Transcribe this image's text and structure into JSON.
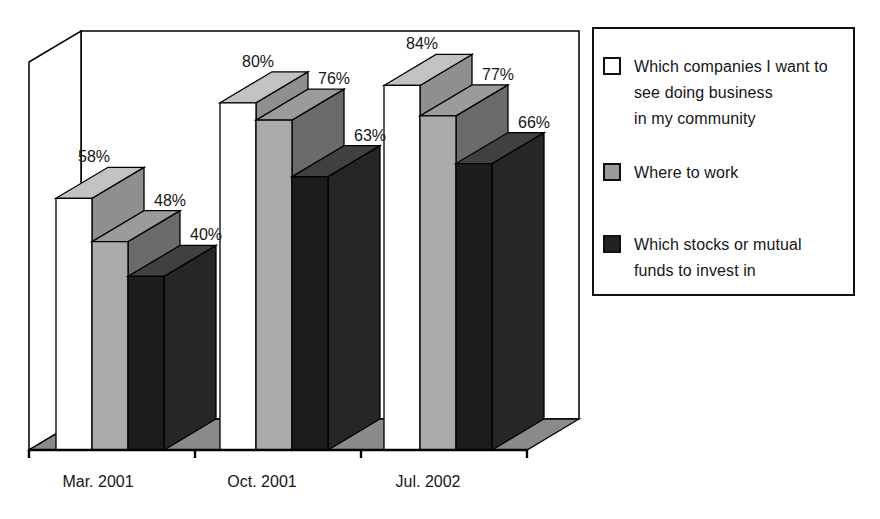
{
  "chart_data": {
    "type": "bar",
    "projection": "3d-oblique",
    "title": "",
    "xlabel": "",
    "ylabel": "",
    "unit": "percent",
    "ylim": [
      0,
      90
    ],
    "grid": false,
    "legend_position": "right",
    "categories": [
      "Mar. 2001",
      "Oct. 2001",
      "Jul. 2002"
    ],
    "series": [
      {
        "name": "Which companies I want to see doing business in my community",
        "values": [
          58,
          80,
          84
        ],
        "data_labels": [
          "58%",
          "80%",
          "84%"
        ],
        "face_front": "#ffffff",
        "face_top": "#c2c2c2",
        "face_side": "#8f8f8f"
      },
      {
        "name": "Where to work",
        "values": [
          48,
          76,
          77
        ],
        "data_labels": [
          "48%",
          "76%",
          "77%"
        ],
        "face_front": "#aaaaaa",
        "face_top": "#9b9b9b",
        "face_side": "#6b6b6b"
      },
      {
        "name": "Which stocks or mutual funds to invest in",
        "values": [
          40,
          63,
          66
        ],
        "data_labels": [
          "40%",
          "63%",
          "66%"
        ],
        "face_front": "#1d1d1d",
        "face_top": "#404040",
        "face_side": "#262626"
      }
    ]
  },
  "legend": {
    "entries": [
      {
        "label": "Which companies I want to\nsee doing business\nin my community",
        "swatch_color": "#ffffff"
      },
      {
        "label": "Where to work",
        "swatch_color": "#999999"
      },
      {
        "label": "Which stocks or mutual\nfunds to invest in",
        "swatch_color": "#222222"
      }
    ]
  },
  "colors": {
    "background": "#ffffff",
    "wall": "#ffffff",
    "floor": "#8a8a8a",
    "outline": "#000000",
    "text": "#161616"
  }
}
